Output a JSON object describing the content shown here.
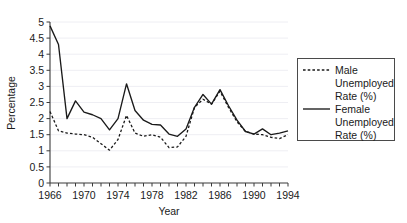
{
  "chart_data": {
    "type": "line",
    "title": "",
    "subtitle": "",
    "xlabel": "Year",
    "ylabel": "Percentage",
    "xlim": [
      1966,
      1994
    ],
    "ylim": [
      0,
      5
    ],
    "y_ticks": [
      0,
      0.5,
      1,
      1.5,
      2,
      2.5,
      3,
      3.5,
      4,
      4.5,
      5
    ],
    "y_tick_labels": [
      "0",
      "0.5",
      "1",
      "1.5",
      "2",
      "2.5",
      "3",
      "3.5",
      "4",
      "4.5",
      "5"
    ],
    "x_ticks": [
      1966,
      1967,
      1968,
      1969,
      1970,
      1971,
      1972,
      1973,
      1974,
      1975,
      1976,
      1977,
      1978,
      1979,
      1980,
      1981,
      1982,
      1983,
      1984,
      1985,
      1986,
      1987,
      1988,
      1989,
      1990,
      1991,
      1992,
      1993,
      1994
    ],
    "x_tick_labels_shown": [
      "1966",
      "1970",
      "1974",
      "1978",
      "1982",
      "1986",
      "1990",
      "1994"
    ],
    "x_label_interval": 4,
    "grid": "horizontal",
    "grid_color": "#ececf2",
    "legend_position": "right-outside",
    "x": [
      1966,
      1967,
      1968,
      1969,
      1970,
      1971,
      1972,
      1973,
      1974,
      1975,
      1976,
      1977,
      1978,
      1979,
      1980,
      1981,
      1982,
      1983,
      1984,
      1985,
      1986,
      1987,
      1988,
      1989,
      1990,
      1991,
      1992,
      1993,
      1994
    ],
    "series": [
      {
        "name": "Male Unemployed Rate (%)",
        "style": "dashed",
        "color": "#1a1a1a",
        "values": [
          2.22,
          1.62,
          1.55,
          1.52,
          1.5,
          1.42,
          1.22,
          1.02,
          1.35,
          2.1,
          1.55,
          1.45,
          1.5,
          1.42,
          1.1,
          1.12,
          1.45,
          2.35,
          2.6,
          2.45,
          2.85,
          2.35,
          1.9,
          1.6,
          1.52,
          1.5,
          1.42,
          1.38,
          1.5
        ]
      },
      {
        "name": "Female Unemployed Rate (%)",
        "style": "solid",
        "color": "#1a1a1a",
        "values": [
          4.88,
          4.3,
          2.0,
          2.55,
          2.2,
          2.12,
          2.0,
          1.65,
          2.0,
          3.08,
          2.25,
          1.95,
          1.82,
          1.8,
          1.52,
          1.45,
          1.68,
          2.35,
          2.75,
          2.45,
          2.9,
          2.4,
          1.95,
          1.6,
          1.52,
          1.68,
          1.5,
          1.55,
          1.62
        ]
      }
    ],
    "legend_entries": [
      {
        "label_lines": [
          "Male",
          "Unemployed",
          "Rate (%)"
        ],
        "style": "dashed"
      },
      {
        "label_lines": [
          "Female",
          "Unemployed",
          "Rate (%)"
        ],
        "style": "solid"
      }
    ]
  },
  "legend": {
    "male_line_1": "Male",
    "male_line_2": "Unemployed",
    "male_line_3": "Rate (%)",
    "female_line_1": "Female",
    "female_line_2": "Unemployed",
    "female_line_3": "Rate (%)"
  },
  "axes": {
    "y_title": "Percentage",
    "x_title": "Year",
    "y_labels": [
      "5",
      "4.5",
      "4",
      "3.5",
      "3",
      "2.5",
      "2",
      "1.5",
      "1",
      "0.5",
      "0"
    ],
    "x_labels": [
      "1966",
      "1970",
      "1974",
      "1978",
      "1982",
      "1986",
      "1990",
      "1994"
    ]
  }
}
